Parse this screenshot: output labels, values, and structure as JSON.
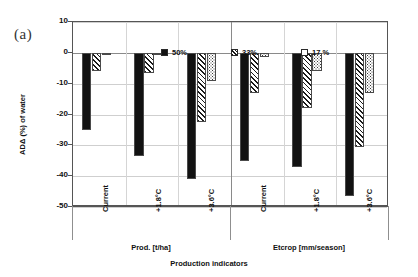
{
  "figure": {
    "panel_label": "(a)",
    "xlabel": "Production indicators",
    "ylabel": "ADΔ (%) of water"
  },
  "chart_data": {
    "type": "bar",
    "title": "",
    "panel": "(a)",
    "xlabel": "Production indicators",
    "ylabel": "ADΔ (%) of water",
    "ylim": [
      -50,
      10
    ],
    "yticks": [
      10,
      0,
      -10,
      -20,
      -30,
      -40,
      -50
    ],
    "ytick_labels": [
      "10",
      "0",
      "-10",
      "-20",
      "-30",
      "-40",
      "-50"
    ],
    "grid": true,
    "legend_position": "top-inside",
    "groups": [
      {
        "name": "Prod. [t/ha]",
        "categories": [
          "Current",
          "+1.8°C",
          "+3.6°C"
        ]
      },
      {
        "name": "Etcrop [mm/season]",
        "categories": [
          "Current",
          "+1.8°C",
          "+3.6°C"
        ]
      }
    ],
    "categories": [
      "Prod. [t/ha] / Current",
      "Prod. [t/ha] / +1.8°C",
      "Prod. [t/ha] / +3.6°C",
      "Etcrop [mm/season] / Current",
      "Etcrop [mm/season] / +1.8°C",
      "Etcrop [mm/season] / +3.6°C"
    ],
    "series": [
      {
        "name": "50%",
        "fill": "solid-black",
        "values": [
          -25.0,
          -33.5,
          -41.0,
          -35.0,
          -37.0,
          -46.5
        ]
      },
      {
        "name": "33%",
        "fill": "diagonal-hatch",
        "values": [
          -6.0,
          -6.5,
          -22.5,
          -13.0,
          -18.0,
          -30.5
        ]
      },
      {
        "name": "17 %",
        "fill": "dotted-light",
        "values": [
          -0.5,
          -0.3,
          -9.0,
          -1.5,
          -6.0,
          -13.0
        ]
      }
    ]
  },
  "legend": {
    "items": [
      {
        "label": "50%"
      },
      {
        "label": "33%"
      },
      {
        "label": "17 %"
      }
    ]
  },
  "axis": {
    "y_ticks": [
      "10",
      "0",
      "-10",
      "-20",
      "-30",
      "-40",
      "-50"
    ],
    "x_ticks": [
      "Current",
      "+1.8°C",
      "+3.6°C",
      "Current",
      "+1.8°C",
      "+3.6°C"
    ],
    "group_labels": [
      "Prod. [t/ha]",
      "Etcrop [mm/season]"
    ]
  },
  "colors": {
    "series_50": "#121212",
    "series_33": "#1a1a1a",
    "series_17": "#3a3a3a",
    "frame": "#555555",
    "grid": "#cfcfcf"
  }
}
